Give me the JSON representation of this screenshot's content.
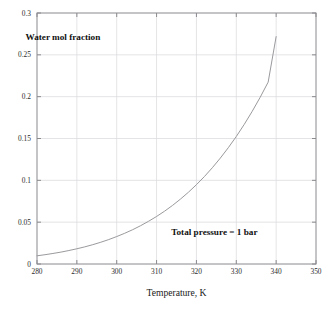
{
  "figure": {
    "background_color": "#ffffff",
    "frame_color": "#8a8a8f",
    "grid_color": "#d8d8dc",
    "curve_color": "#9a9a9e"
  },
  "chart_data": {
    "type": "line",
    "title": "",
    "xlabel": "Temperature, K",
    "ylabel": "",
    "xlim": [
      280,
      350
    ],
    "ylim": [
      0,
      0.3
    ],
    "grid": true,
    "legend": "none",
    "xticks": [
      280,
      290,
      300,
      310,
      320,
      330,
      340,
      350
    ],
    "xtick_labels": [
      "280",
      "290",
      "300",
      "310",
      "320",
      "330",
      "340",
      "350"
    ],
    "yticks": [
      0,
      0.05,
      0.1,
      0.15,
      0.2,
      0.25,
      0.3
    ],
    "ytick_labels": [
      "0",
      "0.05",
      "0.1",
      "0.15",
      "0.2",
      "0.25",
      "0.3"
    ],
    "annotations": [
      {
        "name": "series-label",
        "text": "Water mol fraction",
        "x": 286.5,
        "y": 0.268
      },
      {
        "name": "condition-label",
        "text": "Total pressure = 1 bar",
        "x": 324.5,
        "y": 0.0345
      }
    ],
    "series": [
      {
        "name": "water-mol-fraction",
        "x": [
          280,
          282,
          284,
          286,
          288,
          290,
          292,
          294,
          296,
          298,
          300,
          302,
          304,
          306,
          308,
          310,
          312,
          314,
          316,
          318,
          320,
          322,
          324,
          326,
          328,
          330,
          332,
          334,
          336,
          338,
          340
        ],
        "values": [
          0.0098,
          0.0111,
          0.0126,
          0.0142,
          0.0161,
          0.0182,
          0.0205,
          0.0231,
          0.026,
          0.0292,
          0.0328,
          0.0367,
          0.041,
          0.0458,
          0.0511,
          0.0568,
          0.0631,
          0.07,
          0.0776,
          0.0858,
          0.0948,
          0.1045,
          0.1151,
          0.1266,
          0.139,
          0.1524,
          0.1669,
          0.1825,
          0.1993,
          0.2174,
          0.2718
        ]
      }
    ]
  },
  "geometry": {
    "plot_left": 37,
    "plot_right": 316,
    "plot_top": 13,
    "plot_bottom": 264
  }
}
